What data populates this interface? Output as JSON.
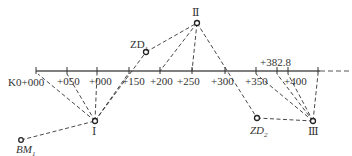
{
  "diagram": {
    "colors": {
      "line": "#555555",
      "dashed": "#333333",
      "text": "#333333",
      "background": "#ffffff"
    },
    "baseline": {
      "y": 71,
      "x_start": 36,
      "x_end_solid": 320,
      "x_end_dashed": 350
    },
    "stations": [
      {
        "label": "K0+000",
        "x": 36
      },
      {
        "label": "+050",
        "x": 67
      },
      {
        "label": "+000",
        "x": 97
      },
      {
        "label": "+150",
        "x": 129
      },
      {
        "label": "+200",
        "x": 160
      },
      {
        "label": "+250",
        "x": 192
      },
      {
        "label": "+300",
        "x": 225
      },
      {
        "label": "+350",
        "x": 256
      },
      {
        "label": "+382.8",
        "x": 277
      },
      {
        "label": "+400",
        "x": 288
      },
      {
        "label": "",
        "x": 318
      }
    ],
    "points": {
      "I": {
        "label": "Ⅰ",
        "x": 95,
        "y": 121
      },
      "II": {
        "label": "Ⅱ",
        "x": 197,
        "y": 23
      },
      "III": {
        "label": "Ⅲ",
        "x": 313,
        "y": 121
      },
      "ZD1": {
        "label": "ZD",
        "sub": "1",
        "x": 146,
        "y": 52
      },
      "ZD2": {
        "label": "ZD",
        "sub": "2",
        "x": 257,
        "y": 118
      },
      "BM1": {
        "label": "BM",
        "sub": "1",
        "x": 21,
        "y": 140
      }
    }
  }
}
